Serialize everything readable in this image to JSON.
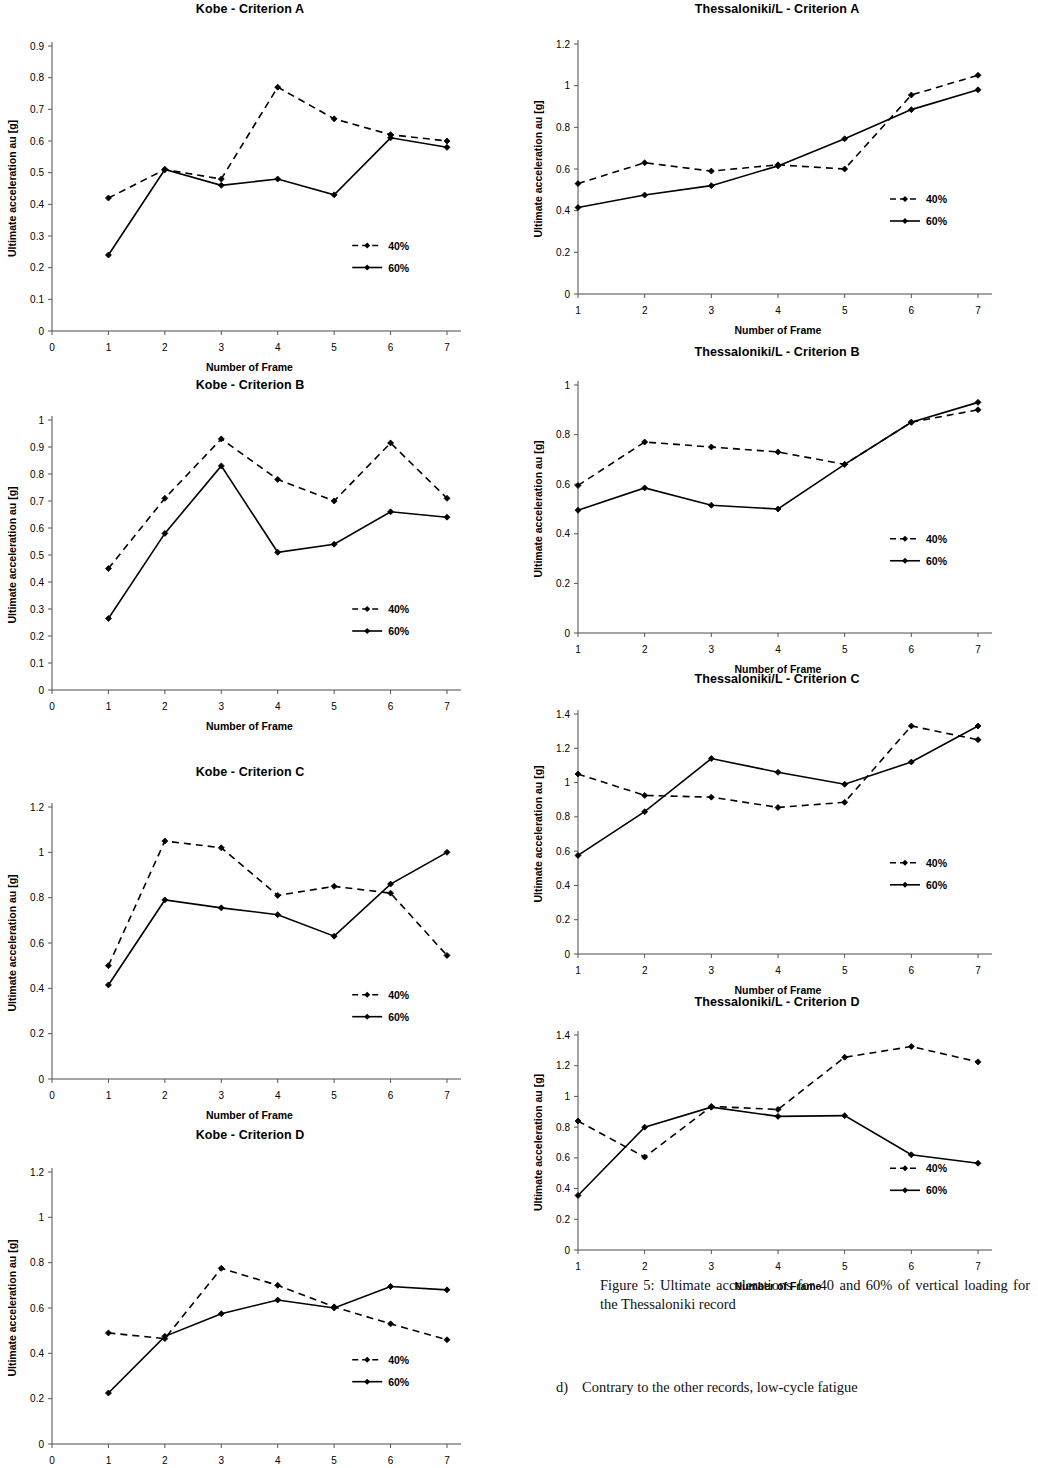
{
  "document": {
    "figure_caption": "Figure 5: Ultimate accelerations for 40 and 60% of vertical loading for the Thessaloniki record",
    "body_marker": "d)",
    "body_text": "Contrary to the other records, low-cycle fatigue"
  },
  "legend": {
    "series_40": "40%",
    "series_60": "60%"
  },
  "axes": {
    "xlabel": "Number of Frame",
    "ylabel": "Ultimate acceleration au [g]"
  },
  "chart_data": [
    {
      "id": "kobe-a",
      "type": "line",
      "title": "Kobe - Criterion A",
      "xlabel": "Number of Frame",
      "ylabel": "Ultimate acceleration au [g]",
      "x": [
        1,
        2,
        3,
        4,
        5,
        6,
        7
      ],
      "xtick_labels": [
        "0",
        "1",
        "2",
        "3",
        "4",
        "5",
        "6",
        "7"
      ],
      "xlim": [
        0,
        7
      ],
      "ylim": [
        0,
        0.9
      ],
      "ytick_labels": [
        "0",
        "0.1",
        "0.2",
        "0.3",
        "0.4",
        "0.5",
        "0.6",
        "0.7",
        "0.8",
        "0.9"
      ],
      "yticks": [
        0,
        0.1,
        0.2,
        0.3,
        0.4,
        0.5,
        0.6,
        0.7,
        0.8,
        0.9
      ],
      "grid": false,
      "legend_position": "right-lower",
      "series": [
        {
          "name": "40%",
          "style": "dashed",
          "values": [
            0.42,
            0.51,
            0.48,
            0.77,
            0.67,
            0.62,
            0.6
          ]
        },
        {
          "name": "60%",
          "style": "solid",
          "values": [
            0.24,
            0.51,
            0.46,
            0.48,
            0.43,
            0.61,
            0.58
          ]
        }
      ]
    },
    {
      "id": "kobe-b",
      "type": "line",
      "title": "Kobe - Criterion B",
      "xlabel": "Number of Frame",
      "ylabel": "Ultimate acceleration au [g]",
      "x": [
        1,
        2,
        3,
        4,
        5,
        6,
        7
      ],
      "xtick_labels": [
        "0",
        "1",
        "2",
        "3",
        "4",
        "5",
        "6",
        "7"
      ],
      "xlim": [
        0,
        7
      ],
      "ylim": [
        0,
        1.0
      ],
      "ytick_labels": [
        "0",
        "0.1",
        "0.2",
        "0.3",
        "0.4",
        "0.5",
        "0.6",
        "0.7",
        "0.8",
        "0.9",
        "1"
      ],
      "yticks": [
        0,
        0.1,
        0.2,
        0.3,
        0.4,
        0.5,
        0.6,
        0.7,
        0.8,
        0.9,
        1.0
      ],
      "grid": false,
      "legend_position": "right-lower",
      "series": [
        {
          "name": "40%",
          "style": "dashed",
          "values": [
            0.45,
            0.71,
            0.93,
            0.78,
            0.7,
            0.915,
            0.71
          ]
        },
        {
          "name": "60%",
          "style": "solid",
          "values": [
            0.265,
            0.58,
            0.83,
            0.51,
            0.54,
            0.66,
            0.64
          ]
        }
      ]
    },
    {
      "id": "kobe-c",
      "type": "line",
      "title": "Kobe - Criterion C",
      "xlabel": "Number of Frame",
      "ylabel": "Ultimate acceleration au [g]",
      "x": [
        1,
        2,
        3,
        4,
        5,
        6,
        7
      ],
      "xtick_labels": [
        "0",
        "1",
        "2",
        "3",
        "4",
        "5",
        "6",
        "7"
      ],
      "xlim": [
        0,
        7
      ],
      "ylim": [
        0,
        1.2
      ],
      "ytick_labels": [
        "0",
        "0.2",
        "0.4",
        "0.6",
        "0.8",
        "1",
        "1.2"
      ],
      "yticks": [
        0,
        0.2,
        0.4,
        0.6,
        0.8,
        1.0,
        1.2
      ],
      "grid": false,
      "legend_position": "right-lower",
      "series": [
        {
          "name": "40%",
          "style": "dashed",
          "values": [
            0.5,
            1.05,
            1.02,
            0.81,
            0.85,
            0.82,
            0.545
          ]
        },
        {
          "name": "60%",
          "style": "solid",
          "values": [
            0.415,
            0.79,
            0.755,
            0.725,
            0.63,
            0.86,
            1.0
          ]
        }
      ]
    },
    {
      "id": "kobe-d",
      "type": "line",
      "title": "Kobe - Criterion D",
      "xlabel": "Number of Frame",
      "ylabel": "Ultimate acceleration au [g]",
      "x": [
        1,
        2,
        3,
        4,
        5,
        6,
        7
      ],
      "xtick_labels": [
        "0",
        "1",
        "2",
        "3",
        "4",
        "5",
        "6",
        "7"
      ],
      "xlim": [
        0,
        7
      ],
      "ylim": [
        0,
        1.2
      ],
      "ytick_labels": [
        "0",
        "0.2",
        "0.4",
        "0.6",
        "0.8",
        "1",
        "1.2"
      ],
      "yticks": [
        0,
        0.2,
        0.4,
        0.6,
        0.8,
        1.0,
        1.2
      ],
      "grid": false,
      "legend_position": "right-lower",
      "clipped_bottom": true,
      "series": [
        {
          "name": "40%",
          "style": "dashed",
          "values": [
            0.49,
            0.465,
            0.775,
            0.7,
            0.605,
            0.53,
            0.46
          ]
        },
        {
          "name": "60%",
          "style": "solid",
          "values": [
            0.225,
            0.475,
            0.575,
            0.635,
            0.6,
            0.695,
            0.68
          ]
        }
      ]
    },
    {
      "id": "thess-a",
      "type": "line",
      "title": "Thessaloniki/L - Criterion A",
      "xlabel": "Number of Frame",
      "ylabel": "Ultimate acceleration au [g]",
      "x": [
        1,
        2,
        3,
        4,
        5,
        6,
        7
      ],
      "xtick_labels": [
        "1",
        "2",
        "3",
        "4",
        "5",
        "6",
        "7"
      ],
      "xlim": [
        1,
        7
      ],
      "ylim": [
        0,
        1.2
      ],
      "ytick_labels": [
        "0",
        "0.2",
        "0.4",
        "0.6",
        "0.8",
        "1",
        "1.2"
      ],
      "yticks": [
        0,
        0.2,
        0.4,
        0.6,
        0.8,
        1.0,
        1.2
      ],
      "grid": false,
      "legend_position": "right-lower",
      "series": [
        {
          "name": "40%",
          "style": "dashed",
          "values": [
            0.53,
            0.63,
            0.59,
            0.62,
            0.6,
            0.955,
            1.05
          ]
        },
        {
          "name": "60%",
          "style": "solid",
          "values": [
            0.415,
            0.475,
            0.52,
            0.615,
            0.745,
            0.885,
            0.98
          ]
        }
      ]
    },
    {
      "id": "thess-b",
      "type": "line",
      "title": "Thessaloniki/L - Criterion B",
      "xlabel": "Number of Frame",
      "ylabel": "Ultimate acceleration au [g]",
      "x": [
        1,
        2,
        3,
        4,
        5,
        6,
        7
      ],
      "xtick_labels": [
        "1",
        "2",
        "3",
        "4",
        "5",
        "6",
        "7"
      ],
      "xlim": [
        1,
        7
      ],
      "ylim": [
        0,
        1.0
      ],
      "ytick_labels": [
        "0",
        "0.2",
        "0.4",
        "0.6",
        "0.8",
        "1"
      ],
      "yticks": [
        0,
        0.2,
        0.4,
        0.6,
        0.8,
        1.0
      ],
      "grid": false,
      "legend_position": "right-lower",
      "series": [
        {
          "name": "40%",
          "style": "dashed",
          "values": [
            0.595,
            0.77,
            0.75,
            0.73,
            0.68,
            0.85,
            0.9
          ]
        },
        {
          "name": "60%",
          "style": "solid",
          "values": [
            0.495,
            0.585,
            0.515,
            0.5,
            0.68,
            0.85,
            0.93
          ]
        }
      ]
    },
    {
      "id": "thess-c",
      "type": "line",
      "title": "Thessaloniki/L - Criterion C",
      "xlabel": "Number of Frame",
      "ylabel": "Ultimate acceleration au [g]",
      "x": [
        1,
        2,
        3,
        4,
        5,
        6,
        7
      ],
      "xtick_labels": [
        "1",
        "2",
        "3",
        "4",
        "5",
        "6",
        "7"
      ],
      "xlim": [
        1,
        7
      ],
      "ylim": [
        0,
        1.4
      ],
      "ytick_labels": [
        "0",
        "0.2",
        "0.4",
        "0.6",
        "0.8",
        "1",
        "1.2",
        "1.4"
      ],
      "yticks": [
        0,
        0.2,
        0.4,
        0.6,
        0.8,
        1.0,
        1.2,
        1.4
      ],
      "grid": false,
      "legend_position": "right-lower",
      "series": [
        {
          "name": "40%",
          "style": "dashed",
          "values": [
            1.05,
            0.925,
            0.915,
            0.855,
            0.885,
            1.33,
            1.25
          ]
        },
        {
          "name": "60%",
          "style": "solid",
          "values": [
            0.575,
            0.83,
            1.14,
            1.06,
            0.99,
            1.12,
            1.33
          ]
        }
      ]
    },
    {
      "id": "thess-d",
      "type": "line",
      "title": "Thessaloniki/L - Criterion D",
      "xlabel": "Number of Frame",
      "ylabel": "Ultimate acceleration au [g]",
      "x": [
        1,
        2,
        3,
        4,
        5,
        6,
        7
      ],
      "xtick_labels": [
        "1",
        "2",
        "3",
        "4",
        "5",
        "6",
        "7"
      ],
      "xlim": [
        1,
        7
      ],
      "ylim": [
        0,
        1.4
      ],
      "ytick_labels": [
        "0",
        "0.2",
        "0.4",
        "0.6",
        "0.8",
        "1",
        "1.2",
        "1.4"
      ],
      "yticks": [
        0,
        0.2,
        0.4,
        0.6,
        0.8,
        1.0,
        1.2,
        1.4
      ],
      "grid": false,
      "legend_position": "right-lower",
      "series": [
        {
          "name": "40%",
          "style": "dashed",
          "values": [
            0.84,
            0.605,
            0.935,
            0.915,
            1.255,
            1.325,
            1.225
          ]
        },
        {
          "name": "60%",
          "style": "solid",
          "values": [
            0.355,
            0.8,
            0.93,
            0.87,
            0.875,
            0.62,
            0.565
          ]
        }
      ]
    }
  ],
  "layout": {
    "kobe-a": {
      "left": 0,
      "top": 2,
      "w": 500,
      "h": 355,
      "plotL": 52,
      "plotT": 30,
      "plotW": 395,
      "plotH": 285,
      "legx": 0.76,
      "legy": 0.7
    },
    "kobe-b": {
      "left": 0,
      "top": 378,
      "w": 500,
      "h": 345,
      "plotL": 52,
      "plotT": 28,
      "plotW": 395,
      "plotH": 270,
      "legx": 0.76,
      "legy": 0.7
    },
    "kobe-c": {
      "left": 0,
      "top": 765,
      "w": 500,
      "h": 345,
      "plotL": 52,
      "plotT": 28,
      "plotW": 395,
      "plotH": 272,
      "legx": 0.76,
      "legy": 0.69
    },
    "kobe-d": {
      "left": 0,
      "top": 1128,
      "w": 500,
      "h": 340,
      "plotL": 52,
      "plotT": 30,
      "plotW": 395,
      "plotH": 272,
      "legx": 0.76,
      "legy": 0.69
    },
    "thess-a": {
      "left": 516,
      "top": 2,
      "w": 522,
      "h": 330,
      "plotL": 62,
      "plotT": 28,
      "plotW": 400,
      "plotH": 250,
      "legx": 0.78,
      "legy": 0.62
    },
    "thess-b": {
      "left": 516,
      "top": 345,
      "w": 522,
      "h": 322,
      "plotL": 62,
      "plotT": 26,
      "plotW": 400,
      "plotH": 248,
      "legx": 0.78,
      "legy": 0.62
    },
    "thess-c": {
      "left": 516,
      "top": 672,
      "w": 522,
      "h": 320,
      "plotL": 62,
      "plotT": 28,
      "plotW": 400,
      "plotH": 240,
      "legx": 0.78,
      "legy": 0.62
    },
    "thess-d": {
      "left": 516,
      "top": 995,
      "w": 522,
      "h": 275,
      "plotL": 62,
      "plotT": 26,
      "plotW": 400,
      "plotH": 215,
      "legx": 0.78,
      "legy": 0.62
    }
  }
}
